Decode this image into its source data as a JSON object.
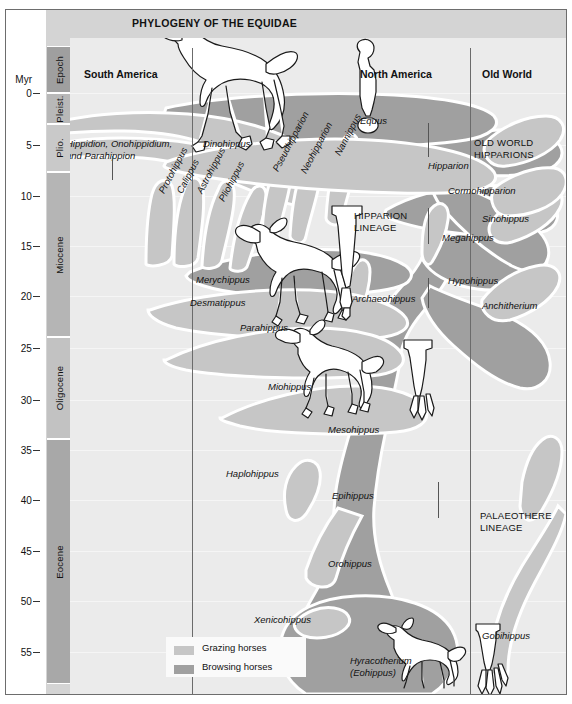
{
  "title": "PHYLOGENY OF THE EQUIDAE",
  "axis": {
    "unit_label": "Myr",
    "epoch_header": "Epoch",
    "ticks": [
      {
        "value": "0",
        "y": 93
      },
      {
        "value": "5",
        "y": 145
      },
      {
        "value": "10",
        "y": 196
      },
      {
        "value": "15",
        "y": 246
      },
      {
        "value": "20",
        "y": 296
      },
      {
        "value": "25",
        "y": 348
      },
      {
        "value": "30",
        "y": 400
      },
      {
        "value": "35",
        "y": 450
      },
      {
        "value": "40",
        "y": 500
      },
      {
        "value": "45",
        "y": 551
      },
      {
        "value": "50",
        "y": 601
      },
      {
        "value": "55",
        "y": 652
      }
    ],
    "epochs": [
      {
        "name": "Epoch",
        "top": 46,
        "height": 47,
        "color": "#9f9f9f"
      },
      {
        "name": "Pleist.",
        "top": 93,
        "height": 31,
        "color": "#b8b8b8"
      },
      {
        "name": "Plio.",
        "top": 124,
        "height": 48,
        "color": "#c9c9c9"
      },
      {
        "name": "Miocene",
        "top": 172,
        "height": 165,
        "color": "#b5b5b5"
      },
      {
        "name": "Oligocene",
        "top": 337,
        "height": 102,
        "color": "#c2c2c2"
      },
      {
        "name": "Eocene",
        "top": 439,
        "height": 245,
        "color": "#a8a8a8"
      }
    ]
  },
  "columns": [
    {
      "name": "South America",
      "x": 14
    },
    {
      "name": "North America",
      "x": 290
    },
    {
      "name": "Old World",
      "x": 412
    }
  ],
  "dividers": [
    122,
    400
  ],
  "colors": {
    "page_background": "#ffffff",
    "frame_fill": "#d4d4d4",
    "plot_background": "#ebebeb",
    "grazing": "#c6c6c6",
    "browsing": "#a0a0a0",
    "tree_outline": "#ffffff",
    "border": "#6d6d6d"
  },
  "legend": {
    "items": [
      {
        "label": "Grazing horses",
        "color": "#c6c6c6"
      },
      {
        "label": "Browsing horses",
        "color": "#a0a0a0"
      }
    ]
  },
  "group_labels": [
    {
      "text": "OLD WORLD\nHIPPARIONS",
      "x": 404,
      "y": 127
    },
    {
      "text": "HIPPARION\nLINEAGE",
      "x": 284,
      "y": 200
    },
    {
      "text": "PALAEOTHERE\nLINEAGE",
      "x": 410,
      "y": 500
    }
  ],
  "taxa": [
    {
      "name": "Hippidion, Onohippidium,\nand Parahippion",
      "x": -4,
      "y": 128,
      "rotate": 0,
      "multiline": true
    },
    {
      "name": "Dinohippus",
      "x": 133,
      "y": 128,
      "rotate": 0
    },
    {
      "name": "Equus",
      "x": 290,
      "y": 105,
      "rotate": 0
    },
    {
      "name": "Hipparion",
      "x": 358,
      "y": 150,
      "rotate": 0
    },
    {
      "name": "Cormohipparion",
      "x": 378,
      "y": 175,
      "rotate": 0
    },
    {
      "name": "Megahippus",
      "x": 372,
      "y": 222,
      "rotate": 0
    },
    {
      "name": "Sinohippus",
      "x": 412,
      "y": 203,
      "rotate": 0
    },
    {
      "name": "Hypohippus",
      "x": 378,
      "y": 265,
      "rotate": 0
    },
    {
      "name": "Anchitherium",
      "x": 412,
      "y": 290,
      "rotate": 0
    },
    {
      "name": "Archaeohippus",
      "x": 282,
      "y": 283,
      "rotate": 0
    },
    {
      "name": "Protohippus",
      "x": 86,
      "y": 180,
      "rotate": -62
    },
    {
      "name": "Calippus",
      "x": 104,
      "y": 180,
      "rotate": -62
    },
    {
      "name": "Astrohippus",
      "x": 124,
      "y": 180,
      "rotate": -62
    },
    {
      "name": "Pliohippus",
      "x": 146,
      "y": 188,
      "rotate": -62
    },
    {
      "name": "Pseudhipparion",
      "x": 200,
      "y": 158,
      "rotate": -62
    },
    {
      "name": "Neohipparion",
      "x": 228,
      "y": 160,
      "rotate": -62
    },
    {
      "name": "Nannippus",
      "x": 262,
      "y": 142,
      "rotate": -62
    },
    {
      "name": "Merychippus",
      "x": 126,
      "y": 264,
      "rotate": 0
    },
    {
      "name": "Desmatippus",
      "x": 120,
      "y": 287,
      "rotate": 0
    },
    {
      "name": "Parahippus",
      "x": 170,
      "y": 312,
      "rotate": 0
    },
    {
      "name": "Miohippus",
      "x": 198,
      "y": 371,
      "rotate": 0
    },
    {
      "name": "Mesohippus",
      "x": 258,
      "y": 414,
      "rotate": 0
    },
    {
      "name": "Haplohippus",
      "x": 156,
      "y": 458,
      "rotate": 0
    },
    {
      "name": "Epihippus",
      "x": 262,
      "y": 480,
      "rotate": 0
    },
    {
      "name": "Orohippus",
      "x": 258,
      "y": 548,
      "rotate": 0
    },
    {
      "name": "Xenicohippus",
      "x": 184,
      "y": 604,
      "rotate": 0
    },
    {
      "name": "Gobihippus",
      "x": 412,
      "y": 620,
      "rotate": 0
    },
    {
      "name": "Hyracotherium\n(Eohippus)",
      "x": 280,
      "y": 645,
      "rotate": 0,
      "multiline": true
    }
  ],
  "illustrations": [
    {
      "name": "modern-horse-skeleton-outline",
      "x": 150,
      "y": 20
    },
    {
      "name": "equus-limb-bone",
      "x": 288,
      "y": 40
    },
    {
      "name": "merychippus-horse-outline",
      "x": 232,
      "y": 218
    },
    {
      "name": "merychippus-limb-bone",
      "x": 334,
      "y": 198
    },
    {
      "name": "miohippus-horse-outline",
      "x": 276,
      "y": 330
    },
    {
      "name": "miohippus-limb-bone",
      "x": 410,
      "y": 330
    },
    {
      "name": "hyracotherium-outline",
      "x": 364,
      "y": 622
    },
    {
      "name": "hyracotherium-limb-bone",
      "x": 424,
      "y": 612
    }
  ]
}
